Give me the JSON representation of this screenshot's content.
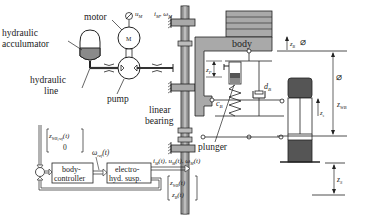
{
  "diagram": {
    "labels": {
      "motor": "motor",
      "hydraulic_accumulator_1": "hydraulic",
      "hydraulic_accumulator_2": "acculumator",
      "hydraulic_line_1": "hydraulic",
      "hydraulic_line_2": "line",
      "pump": "pump",
      "linear_bearing_1": "linear",
      "linear_bearing_2": "bearing",
      "body": "body",
      "plunger": "plunger",
      "motor_symbol": "M",
      "d_B": "d",
      "d_B_sub": "B",
      "c_B": "c",
      "c_B_sub": "B",
      "z_P": "z",
      "z_P_sub": "P",
      "z_B": "z",
      "z_B_sub": "B",
      "z_WB": "z",
      "z_WB_sub": "WB",
      "z_S": "z",
      "z_S_sub": "S",
      "z_s_small": "z",
      "z_s_small_sub": "s",
      "u_M": "u",
      "u_M_sub": "M",
      "i_M": "i",
      "i_M_sub": "M",
      "omega_M": "ω",
      "omega_M_sub": "M"
    },
    "control": {
      "ref_vector_top": "z",
      "ref_vector_top_sub": "WB,ref",
      "ref_vector_top_arg": "(t)",
      "ref_vector_bottom": "0",
      "body_controller_1": "body-",
      "body_controller_2": "controller",
      "electro_hyd_1": "electro-",
      "electro_hyd_2": "hyd. susp.",
      "omega_ref": "ω",
      "omega_ref_sub": "ref",
      "omega_ref_arg": "(t)",
      "outputs": "i",
      "outputs_text": "(t), u",
      "outputs_text2": "(t), ω",
      "outputs_sub": "M",
      "outputs_end": "(t)",
      "feedback_top": "z",
      "feedback_top_sub": "WB",
      "feedback_top_arg": "(t)",
      "feedback_bottom": "z",
      "feedback_bottom_sub": "B",
      "feedback_bottom_arg": "(t)"
    },
    "colors": {
      "line": "#222222",
      "gray_fill": "#a9a9a9",
      "dark_fill": "#555555",
      "mid_fill": "#8a8a8a"
    }
  }
}
